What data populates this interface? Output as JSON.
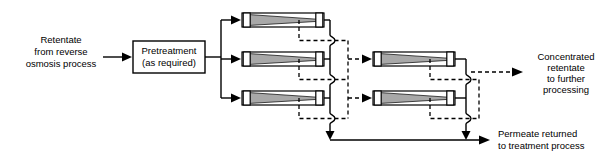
{
  "diagram": {
    "colors": {
      "line": "#000000",
      "background": "#ffffff",
      "module_fill": "#a8a8a8",
      "cap_fill": "#ffffff"
    },
    "inlet": {
      "label_lines": [
        "Retentate",
        "from reverse",
        "osmosis process"
      ],
      "arrow": "arrow-right"
    },
    "pretreatment": {
      "label_lines": [
        "Pretreatment",
        "(as required)"
      ]
    },
    "stage1": {
      "name": "First stage membrane bank",
      "module_count": 3,
      "modules": [
        {
          "id": "stage1-module-1"
        },
        {
          "id": "stage1-module-2"
        },
        {
          "id": "stage1-module-3"
        }
      ]
    },
    "stage2": {
      "name": "Second stage membrane bank",
      "module_count": 2,
      "modules": [
        {
          "id": "stage2-module-1"
        },
        {
          "id": "stage2-module-2"
        }
      ]
    },
    "outlet_retentate": {
      "label_lines": [
        "Concentrated",
        "retentate",
        "to further",
        "processing"
      ],
      "arrow": "arrow-right-dashed"
    },
    "outlet_permeate": {
      "label_lines": [
        "Permeate returned",
        "to treatment process"
      ],
      "arrow": "arrow-right"
    },
    "legend_semantics": {
      "solid_line_meaning": "permeate",
      "dashed_line_meaning": "retentate"
    }
  }
}
